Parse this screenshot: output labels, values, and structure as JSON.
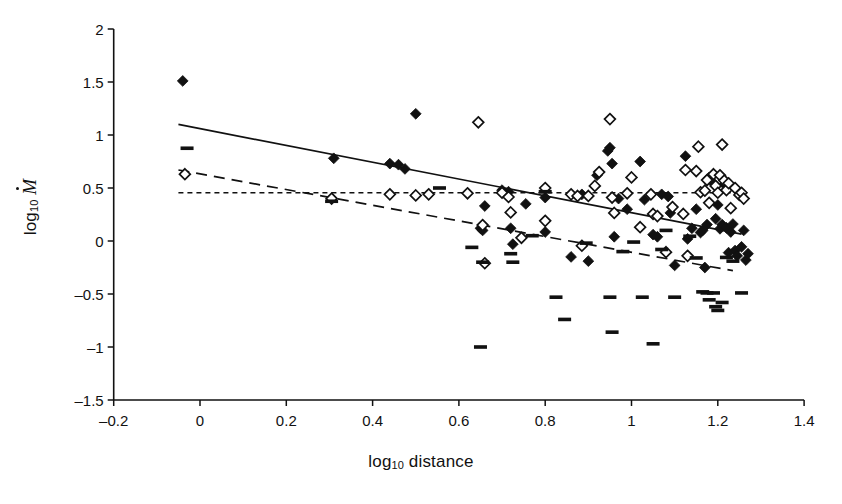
{
  "figure": {
    "background": "#ffffff",
    "ink": "#111111"
  },
  "chart_data": {
    "type": "scatter",
    "title": "",
    "xlabel": "log10 distance",
    "ylabel": "log10 Mdot",
    "xlabel_parts": {
      "base": "log",
      "sub": "10",
      "rest": " distance"
    },
    "ylabel_parts": {
      "base": "log",
      "sub": "10",
      "rest": " Ṁ"
    },
    "xlim": [
      -0.2,
      1.4
    ],
    "ylim": [
      -1.5,
      2.0
    ],
    "xticks": [
      -0.2,
      0,
      0.2,
      0.4,
      0.6,
      0.8,
      1,
      1.2,
      1.4
    ],
    "xticklabels": [
      "–0.2",
      "0",
      "0.2",
      "0.4",
      "0.6",
      "0.8",
      "1",
      "1.2",
      "1.4"
    ],
    "yticks": [
      -1.5,
      -1,
      -0.5,
      0,
      0.5,
      1,
      1.5,
      2
    ],
    "yticklabels": [
      "–1.5",
      "–1",
      "–0.5",
      "0",
      "0.5",
      "1",
      "1.5",
      "2"
    ],
    "grid": false,
    "legend": "none",
    "axes_style": "left-and-bottom-spines, ticks outward",
    "series": [
      {
        "name": "filled-diamond",
        "marker": "filled-diamond",
        "color": "#111111",
        "points": [
          [
            -0.04,
            1.51
          ],
          [
            0.5,
            1.2
          ],
          [
            0.31,
            0.78
          ],
          [
            0.44,
            0.73
          ],
          [
            0.46,
            0.72
          ],
          [
            0.475,
            0.68
          ],
          [
            0.65,
            0.12
          ],
          [
            0.655,
            0.1
          ],
          [
            0.66,
            0.33
          ],
          [
            0.7,
            0.48
          ],
          [
            0.715,
            0.465
          ],
          [
            0.72,
            0.12
          ],
          [
            0.725,
            -0.03
          ],
          [
            0.755,
            0.35
          ],
          [
            0.8,
            0.41
          ],
          [
            0.8,
            0.085
          ],
          [
            0.86,
            -0.15
          ],
          [
            0.885,
            0.44
          ],
          [
            0.9,
            -0.19
          ],
          [
            0.92,
            0.62
          ],
          [
            0.945,
            0.85
          ],
          [
            0.95,
            0.88
          ],
          [
            0.955,
            0.73
          ],
          [
            0.96,
            0.04
          ],
          [
            0.97,
            0.4
          ],
          [
            0.99,
            0.3
          ],
          [
            1.02,
            0.75
          ],
          [
            1.03,
            0.39
          ],
          [
            1.05,
            0.06
          ],
          [
            1.06,
            0.04
          ],
          [
            1.07,
            0.44
          ],
          [
            1.085,
            0.42
          ],
          [
            1.09,
            0.265
          ],
          [
            1.1,
            -0.23
          ],
          [
            1.125,
            0.8
          ],
          [
            1.13,
            0.02
          ],
          [
            1.14,
            0.12
          ],
          [
            1.15,
            0.3
          ],
          [
            1.16,
            0.08
          ],
          [
            1.165,
            0.1
          ],
          [
            1.17,
            -0.25
          ],
          [
            1.175,
            0.155
          ],
          [
            1.18,
            0.6
          ],
          [
            1.19,
            0.545
          ],
          [
            1.195,
            0.21
          ],
          [
            1.2,
            0.34
          ],
          [
            1.205,
            0.115
          ],
          [
            1.21,
            0.155
          ],
          [
            1.215,
            0.535
          ],
          [
            1.22,
            0.125
          ],
          [
            1.225,
            -0.11
          ],
          [
            1.23,
            0.085
          ],
          [
            1.235,
            0.16
          ],
          [
            1.24,
            -0.09
          ],
          [
            1.245,
            -0.14
          ],
          [
            1.25,
            0.455
          ],
          [
            1.255,
            -0.055
          ],
          [
            1.26,
            0.1
          ],
          [
            1.265,
            -0.18
          ],
          [
            1.27,
            -0.12
          ]
        ]
      },
      {
        "name": "open-diamond",
        "marker": "open-diamond",
        "color": "#111111",
        "points": [
          [
            -0.035,
            0.63
          ],
          [
            0.305,
            0.4
          ],
          [
            0.44,
            0.44
          ],
          [
            0.5,
            0.43
          ],
          [
            0.53,
            0.44
          ],
          [
            0.62,
            0.45
          ],
          [
            0.645,
            1.12
          ],
          [
            0.655,
            0.15
          ],
          [
            0.66,
            -0.21
          ],
          [
            0.7,
            0.455
          ],
          [
            0.715,
            0.415
          ],
          [
            0.72,
            0.27
          ],
          [
            0.745,
            0.03
          ],
          [
            0.8,
            0.5
          ],
          [
            0.8,
            0.19
          ],
          [
            0.86,
            0.44
          ],
          [
            0.875,
            0.425
          ],
          [
            0.885,
            -0.045
          ],
          [
            0.9,
            0.425
          ],
          [
            0.915,
            0.52
          ],
          [
            0.925,
            0.65
          ],
          [
            0.95,
            1.15
          ],
          [
            0.955,
            0.41
          ],
          [
            0.96,
            0.265
          ],
          [
            0.99,
            0.45
          ],
          [
            1.0,
            0.6
          ],
          [
            1.02,
            0.13
          ],
          [
            1.045,
            0.44
          ],
          [
            1.05,
            0.255
          ],
          [
            1.06,
            0.235
          ],
          [
            1.08,
            -0.105
          ],
          [
            1.095,
            0.32
          ],
          [
            1.12,
            0.255
          ],
          [
            1.125,
            0.67
          ],
          [
            1.13,
            -0.14
          ],
          [
            1.15,
            0.66
          ],
          [
            1.155,
            0.89
          ],
          [
            1.16,
            0.46
          ],
          [
            1.17,
            0.475
          ],
          [
            1.175,
            0.575
          ],
          [
            1.18,
            0.36
          ],
          [
            1.19,
            0.63
          ],
          [
            1.195,
            0.52
          ],
          [
            1.2,
            0.455
          ],
          [
            1.205,
            0.62
          ],
          [
            1.21,
            0.91
          ],
          [
            1.215,
            0.57
          ],
          [
            1.22,
            0.48
          ],
          [
            1.225,
            0.545
          ],
          [
            1.23,
            0.31
          ],
          [
            1.24,
            0.5
          ],
          [
            1.25,
            0.435
          ],
          [
            1.255,
            0.455
          ],
          [
            1.26,
            0.4
          ]
        ]
      },
      {
        "name": "dash",
        "marker": "horizontal-dash",
        "color": "#111111",
        "points": [
          [
            -0.03,
            0.875
          ],
          [
            0.305,
            0.375
          ],
          [
            0.555,
            0.5
          ],
          [
            0.63,
            -0.06
          ],
          [
            0.65,
            -1.0
          ],
          [
            0.655,
            -0.2
          ],
          [
            0.72,
            -0.12
          ],
          [
            0.725,
            -0.2
          ],
          [
            0.77,
            0.05
          ],
          [
            0.8,
            0.465
          ],
          [
            0.825,
            -0.53
          ],
          [
            0.845,
            -0.74
          ],
          [
            0.895,
            -0.02
          ],
          [
            0.95,
            -0.53
          ],
          [
            0.955,
            -0.86
          ],
          [
            0.98,
            -0.1
          ],
          [
            1.005,
            -0.01
          ],
          [
            1.025,
            -0.53
          ],
          [
            1.05,
            -0.97
          ],
          [
            1.07,
            -0.08
          ],
          [
            1.08,
            0.1
          ],
          [
            1.1,
            -0.53
          ],
          [
            1.135,
            0.045
          ],
          [
            1.15,
            -0.16
          ],
          [
            1.165,
            -0.48
          ],
          [
            1.175,
            -0.49
          ],
          [
            1.18,
            -0.555
          ],
          [
            1.19,
            -0.49
          ],
          [
            1.195,
            -0.62
          ],
          [
            1.2,
            -0.655
          ],
          [
            1.21,
            -0.58
          ],
          [
            1.22,
            -0.155
          ],
          [
            1.235,
            -0.19
          ],
          [
            1.255,
            -0.49
          ]
        ]
      }
    ],
    "fit_lines": [
      {
        "name": "solid-fit",
        "style": "solid",
        "x": [
          -0.05,
          1.255
        ],
        "y": [
          1.1,
          0.065
        ]
      },
      {
        "name": "dashed-fit",
        "style": "long-dashed",
        "x": [
          -0.05,
          1.235
        ],
        "y": [
          0.67,
          -0.28
        ]
      },
      {
        "name": "dotted-fit",
        "style": "short-dotted",
        "x": [
          -0.05,
          1.23
        ],
        "y": [
          0.455,
          0.455
        ]
      }
    ]
  }
}
